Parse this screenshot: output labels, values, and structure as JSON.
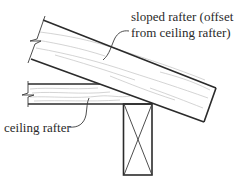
{
  "diagram": {
    "type": "construction-detail",
    "labels": {
      "sloped_rafter_line1": "sloped rafter (offset",
      "sloped_rafter_line2": "from ceiling rafter)",
      "ceiling_rafter": "ceiling rafter"
    },
    "components": [
      {
        "id": "sloped-rafter",
        "description": "sloped rafter with wood grain, broken at left end"
      },
      {
        "id": "ceiling-rafter",
        "description": "horizontal ceiling rafter with wood grain, broken at left end, hidden end shown dashed"
      },
      {
        "id": "post",
        "description": "vertical support member shown in section with X cross"
      }
    ],
    "colors": {
      "line": "#2b2b2b",
      "grain": "#c9c9c9",
      "hidden_line": "#7a7a7a",
      "background": "#ffffff"
    }
  }
}
